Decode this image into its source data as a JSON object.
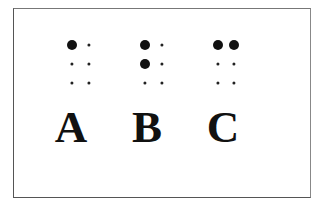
{
  "diagram": {
    "cells": [
      {
        "letter": "A",
        "raised_dots": [
          1
        ],
        "cx": [
          72,
          89
        ],
        "label_x": 71
      },
      {
        "letter": "B",
        "raised_dots": [
          1,
          2
        ],
        "cx": [
          145,
          162
        ],
        "label_x": 147
      },
      {
        "letter": "C",
        "raised_dots": [
          1,
          4
        ],
        "cx": [
          218,
          234
        ],
        "label_x": 223
      }
    ],
    "row_y": [
      44.5,
      63.7,
      82.7
    ],
    "colors": {
      "dot": "#111111",
      "border": "#555555",
      "background": "#ffffff"
    }
  }
}
